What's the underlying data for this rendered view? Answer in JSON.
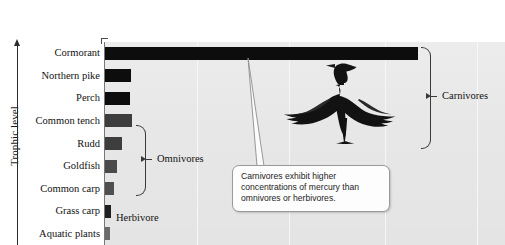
{
  "chart_data": {
    "type": "bar",
    "title": "",
    "xlabel": "",
    "ylabel": "Trophic level",
    "orientation": "horizontal",
    "grid": true,
    "gridlines_x": [
      0.23,
      0.46,
      0.7,
      0.93
    ],
    "xlim": [
      0,
      1
    ],
    "categories": [
      "Cormorant",
      "Northern pike",
      "Perch",
      "Common tench",
      "Rudd",
      "Goldfish",
      "Common carp",
      "Grass carp",
      "Aquatic plants"
    ],
    "values": [
      0.783,
      0.065,
      0.063,
      0.068,
      0.043,
      0.03,
      0.023,
      0.015,
      0.013
    ],
    "bar_colors": [
      "#0d0d0d",
      "#0d0d0d",
      "#0d0d0d",
      "#3d3d3d",
      "#3d3d3d",
      "#4a4a4a",
      "#4f4f4f",
      "#1f1f1f",
      "#6a6a6a"
    ],
    "groups": [
      {
        "label": "Carnivores",
        "members": [
          "Cormorant",
          "Northern pike",
          "Perch"
        ]
      },
      {
        "label": "Omnivores",
        "members": [
          "Common tench",
          "Rudd",
          "Goldfish",
          "Common carp"
        ]
      },
      {
        "label": "Herbivore",
        "members": [
          "Grass carp"
        ]
      }
    ],
    "annotation": "Carnivores exhibit higher concentrations of mercury than omnivores or herbivores.",
    "illustration": "cormorant-bird",
    "plot_background": "#e8e8e8",
    "gridline_color": "#f7f7f7"
  },
  "axis": {
    "y_title": "Trophic level",
    "arrow_direction": "up"
  },
  "groups": {
    "carnivores_label": "Carnivores",
    "omnivores_label": "Omnivores",
    "herbivore_label": "Herbivore"
  },
  "callout": {
    "text": "Carnivores exhibit higher concentrations of mercury than omnivores or herbivores."
  }
}
